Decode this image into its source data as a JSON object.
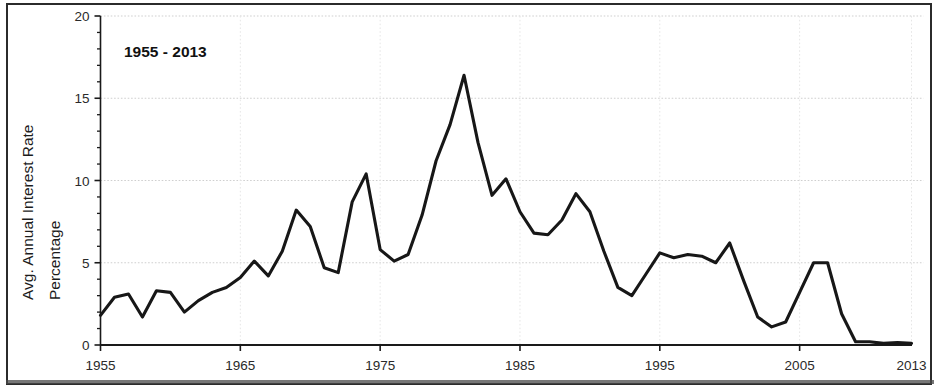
{
  "figure": {
    "title": "1955 - 2013",
    "axis_color": "#1a1a1a",
    "line_color": "#171717",
    "grid_color": "#cfcfcf",
    "background": "#ffffff"
  },
  "axes": {
    "ylabel_line1": "Avg. Annual Interest Rate",
    "ylabel_line2": "Percentage",
    "y_ticks": [
      "0",
      "5",
      "10",
      "15",
      "20"
    ],
    "x_ticks": [
      "1955",
      "1965",
      "1975",
      "1985",
      "1995",
      "2005",
      "2013"
    ]
  },
  "chart_data": {
    "type": "line",
    "title": "1955 - 2013",
    "xlabel": "",
    "ylabel": "Avg. Annual Interest Rate Percentage",
    "xlim": [
      1955,
      2013
    ],
    "ylim": [
      0,
      20
    ],
    "y_ticks": [
      0,
      5,
      10,
      15,
      20
    ],
    "x_ticks": [
      1955,
      1965,
      1975,
      1985,
      1995,
      2005,
      2013
    ],
    "grid": true,
    "legend": "none",
    "series": [
      {
        "name": "Avg. Annual Interest Rate Percentage",
        "x": [
          1955,
          1956,
          1957,
          1958,
          1959,
          1960,
          1961,
          1962,
          1963,
          1964,
          1965,
          1966,
          1967,
          1968,
          1969,
          1970,
          1971,
          1972,
          1973,
          1974,
          1975,
          1976,
          1977,
          1978,
          1979,
          1980,
          1981,
          1982,
          1983,
          1984,
          1985,
          1986,
          1987,
          1988,
          1989,
          1990,
          1991,
          1992,
          1993,
          1994,
          1995,
          1996,
          1997,
          1998,
          1999,
          2000,
          2001,
          2002,
          2003,
          2004,
          2005,
          2006,
          2007,
          2008,
          2009,
          2010,
          2011,
          2012,
          2013
        ],
        "values": [
          1.8,
          2.9,
          3.1,
          1.7,
          3.3,
          3.2,
          2.0,
          2.7,
          3.2,
          3.5,
          4.1,
          5.1,
          4.2,
          5.7,
          8.2,
          7.2,
          4.7,
          4.4,
          8.7,
          10.4,
          5.8,
          5.1,
          5.5,
          7.9,
          11.2,
          13.4,
          16.4,
          12.3,
          9.1,
          10.1,
          8.1,
          6.8,
          6.7,
          7.6,
          9.2,
          8.1,
          5.7,
          3.5,
          3.0,
          4.3,
          5.6,
          5.3,
          5.5,
          5.4,
          5.0,
          6.2,
          3.9,
          1.7,
          1.1,
          1.4,
          3.2,
          5.0,
          5.0,
          1.9,
          0.2,
          0.2,
          0.1,
          0.15,
          0.1
        ]
      }
    ]
  }
}
